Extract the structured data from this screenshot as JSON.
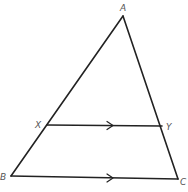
{
  "diagram": {
    "type": "geometry-triangle-with-parallel-segment",
    "points": {
      "A": {
        "label": "A"
      },
      "B": {
        "label": "B"
      },
      "C": {
        "label": "C"
      },
      "X": {
        "label": "X"
      },
      "Y": {
        "label": "Y"
      }
    },
    "segments": [
      {
        "from": "A",
        "to": "B"
      },
      {
        "from": "A",
        "to": "C"
      },
      {
        "from": "B",
        "to": "C",
        "parallel_mark": true
      },
      {
        "from": "X",
        "to": "Y",
        "parallel_mark": true
      }
    ],
    "relations": [
      "XY parallel to BC",
      "X on AB",
      "Y on AC"
    ],
    "colors": {
      "line": "#222222",
      "label": "#555555",
      "background": "#ffffff"
    }
  }
}
